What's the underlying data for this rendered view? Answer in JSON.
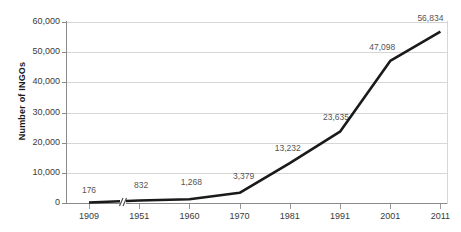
{
  "chart_data": {
    "type": "line",
    "title": "",
    "xlabel": "",
    "ylabel": "Number of INGOs",
    "categories": [
      "1909",
      "1951",
      "1960",
      "1970",
      "1981",
      "1991",
      "2001",
      "2011"
    ],
    "values": [
      176,
      832,
      1268,
      3379,
      13232,
      23635,
      47098,
      56834
    ],
    "point_labels": [
      "176",
      "832",
      "1,268",
      "3,379",
      "13,232",
      "23,635",
      "47,098",
      "56,834"
    ],
    "ylim": [
      0,
      60000
    ],
    "ytick_values": [
      0,
      10000,
      20000,
      30000,
      40000,
      50000,
      60000
    ],
    "ytick_labels": [
      "0",
      "10,000",
      "20,000",
      "30,000",
      "40,000",
      "50,000",
      "60,000"
    ],
    "grid": true,
    "legend": "none",
    "axis_break": {
      "present": true,
      "between": [
        "1909",
        "1951"
      ],
      "marker": "//"
    },
    "colors": {
      "line": "#1a1a1a",
      "grid": "#d6d6d6",
      "axis": "#8a8a8a",
      "tick_label": "#3a3a3a",
      "data_label": "#555555",
      "axis_title": "#1a1a1a",
      "background": "#ffffff"
    }
  }
}
